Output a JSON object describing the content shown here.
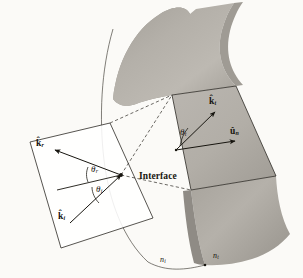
{
  "figure": {
    "type": "optics-ray-diagram",
    "background_color": "#fbfaf7",
    "surface_color": "#b3afa9",
    "surface_shadow_color": "#97938d",
    "tangent_plane_color": "#b8b4ae",
    "line_color": "#17150f"
  },
  "labels": {
    "interface": "Interface",
    "k_reflected": {
      "symbol": "k̂",
      "sub": "r",
      "name": "reflected wave vector"
    },
    "k_incident": {
      "symbol": "k̂",
      "sub": "i",
      "name": "incident wave vector"
    },
    "k_transmitted": {
      "symbol": "k̂",
      "sub": "t",
      "name": "transmitted wave vector"
    },
    "u_normal": {
      "symbol": "û",
      "sub": "n",
      "name": "surface normal unit vector"
    },
    "theta_reflected": {
      "symbol": "θ",
      "sub": "r",
      "name": "angle of reflection"
    },
    "theta_incident": {
      "symbol": "θ",
      "sub": "i",
      "name": "angle of incidence"
    },
    "theta_transmitted": {
      "symbol": "θ",
      "sub": "t",
      "name": "angle of transmission"
    },
    "n_incident": {
      "symbol": "n",
      "sub": "i",
      "name": "refractive index incident medium"
    },
    "n_transmitted": {
      "symbol": "n",
      "sub": "t",
      "name": "refractive index transmitted medium"
    }
  }
}
